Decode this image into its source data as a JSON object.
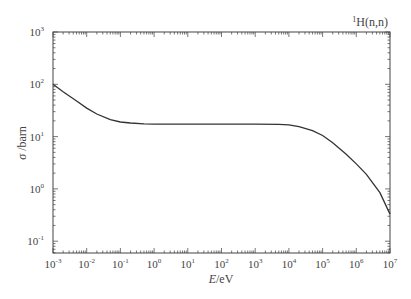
{
  "chart_data": {
    "type": "line",
    "title_superscript": "1",
    "title_main": "H(n,n)",
    "xlabel": "E/eV",
    "xlabel_italic": "E",
    "xlabel_unit": "/eV",
    "ylabel": "σ /barn",
    "ylabel_symbol": "σ",
    "ylabel_unit": " /barn",
    "xscale": "log",
    "yscale": "log",
    "xlim": [
      0.001,
      10000000
    ],
    "ylim": [
      0.05,
      1000
    ],
    "grid": false,
    "legend": null,
    "x_ticks": [
      {
        "base": "10",
        "exp": "-3",
        "value": 0.001
      },
      {
        "base": "10",
        "exp": "-2",
        "value": 0.01
      },
      {
        "base": "10",
        "exp": "-1",
        "value": 0.1
      },
      {
        "base": "10",
        "exp": "0",
        "value": 1
      },
      {
        "base": "10",
        "exp": "1",
        "value": 10
      },
      {
        "base": "10",
        "exp": "2",
        "value": 100
      },
      {
        "base": "10",
        "exp": "3",
        "value": 1000
      },
      {
        "base": "10",
        "exp": "4",
        "value": 10000
      },
      {
        "base": "10",
        "exp": "5",
        "value": 100000
      },
      {
        "base": "10",
        "exp": "6",
        "value": 1000000
      },
      {
        "base": "10",
        "exp": "7",
        "value": 10000000
      }
    ],
    "y_ticks": [
      {
        "base": "10",
        "exp": "-1",
        "value": 0.1
      },
      {
        "base": "10",
        "exp": "0",
        "value": 1
      },
      {
        "base": "10",
        "exp": "1",
        "value": 10
      },
      {
        "base": "10",
        "exp": "2",
        "value": 100
      },
      {
        "base": "10",
        "exp": "3",
        "value": 1000
      }
    ],
    "series": [
      {
        "name": "1H(n,n) elastic cross section",
        "color": "#333333",
        "x": [
          0.001,
          0.002,
          0.005,
          0.01,
          0.02,
          0.05,
          0.1,
          0.2,
          0.5,
          1,
          10,
          100,
          1000,
          5000,
          10000,
          20000,
          50000,
          100000,
          200000,
          500000,
          1000000,
          2000000,
          5000000,
          10000000
        ],
        "y": [
          100,
          72,
          48,
          35,
          27,
          21,
          19,
          18.2,
          17.5,
          17.3,
          17.3,
          17.3,
          17.3,
          17.2,
          16.8,
          15.5,
          13,
          10.5,
          7.6,
          4.6,
          3.0,
          1.9,
          0.85,
          0.33
        ]
      }
    ]
  }
}
